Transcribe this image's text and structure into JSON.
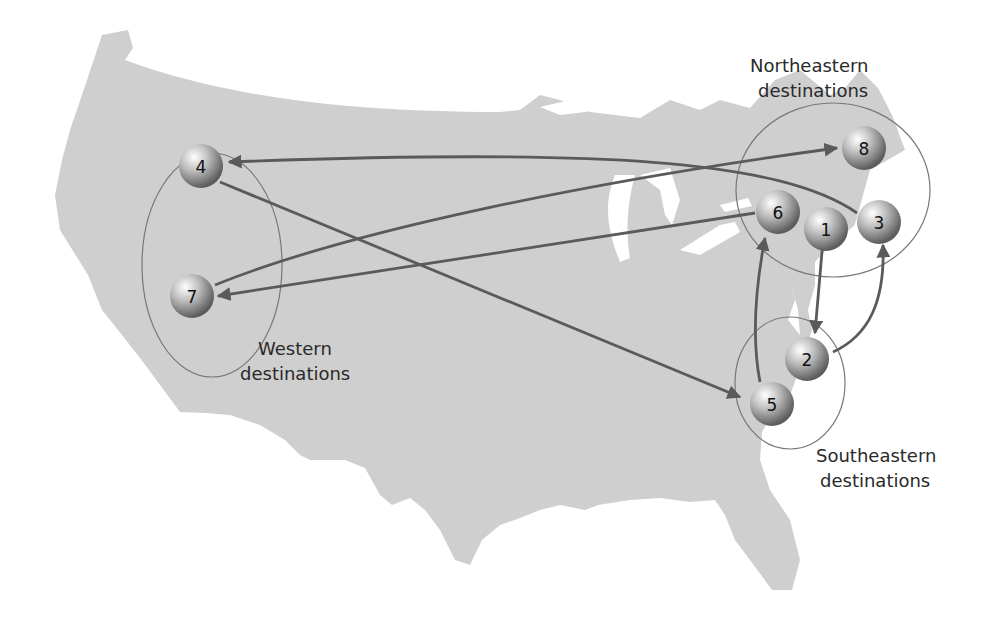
{
  "map": {
    "land_color": "#cfcfcf",
    "water_color": "#ffffff",
    "arrow_color": "#5a5a5a",
    "region_outline_color": "#777777"
  },
  "regions": [
    {
      "id": "western",
      "line1": "Western",
      "line2": "destinations"
    },
    {
      "id": "northeastern",
      "line1": "Northeastern",
      "line2": "destinations"
    },
    {
      "id": "southeastern",
      "line1": "Southeastern",
      "line2": "destinations"
    }
  ],
  "nodes": [
    {
      "id": "1",
      "label": "1",
      "region": "northeastern"
    },
    {
      "id": "2",
      "label": "2",
      "region": "southeastern"
    },
    {
      "id": "3",
      "label": "3",
      "region": "northeastern"
    },
    {
      "id": "4",
      "label": "4",
      "region": "western"
    },
    {
      "id": "5",
      "label": "5",
      "region": "southeastern"
    },
    {
      "id": "6",
      "label": "6",
      "region": "northeastern"
    },
    {
      "id": "7",
      "label": "7",
      "region": "western"
    },
    {
      "id": "8",
      "label": "8",
      "region": "northeastern"
    }
  ],
  "routes": [
    {
      "from": "1",
      "to": "2"
    },
    {
      "from": "2",
      "to": "3"
    },
    {
      "from": "3",
      "to": "4"
    },
    {
      "from": "4",
      "to": "5"
    },
    {
      "from": "5",
      "to": "6"
    },
    {
      "from": "6",
      "to": "7"
    },
    {
      "from": "7",
      "to": "8"
    }
  ]
}
